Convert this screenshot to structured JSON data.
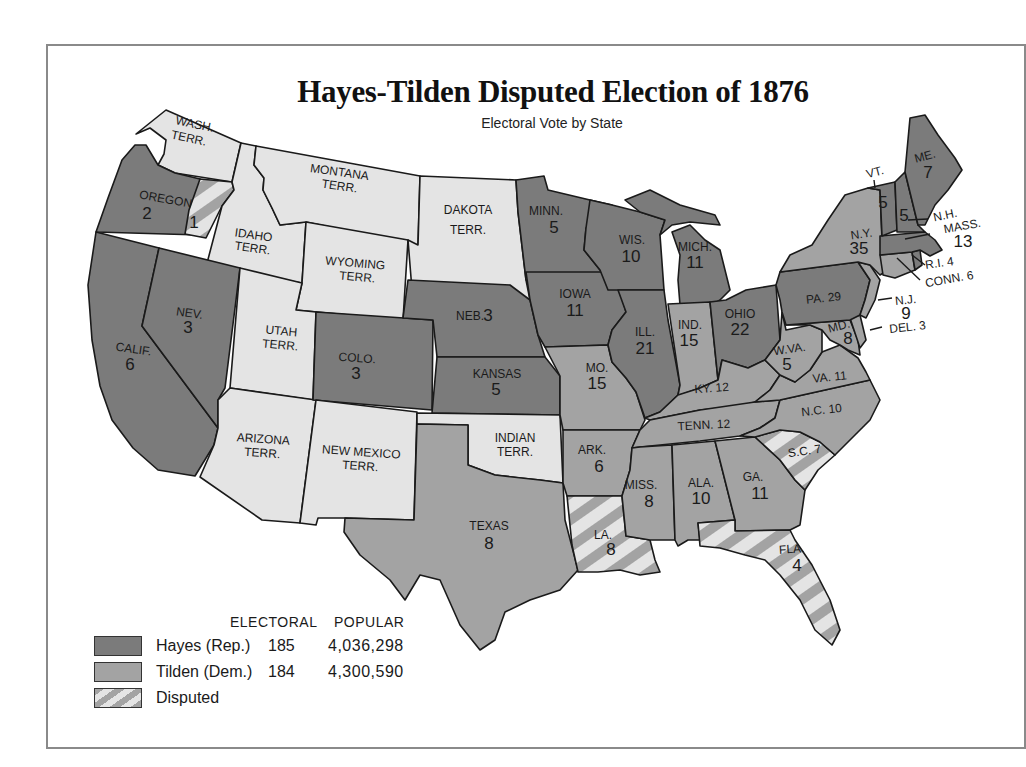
{
  "title": "Hayes-Tilden Disputed Election of 1876",
  "subtitle": "Electoral Vote by State",
  "colors": {
    "hayes": "#7b7b7b",
    "tilden": "#a3a3a3",
    "territory": "#e4e4e4",
    "disputed_stripe_a": "#a3a3a3",
    "disputed_stripe_b": "#e4e4e4",
    "frame": "#8a8a8a"
  },
  "legend": {
    "header_electoral": "ELECTORAL",
    "header_popular": "POPULAR",
    "entries": [
      {
        "key": "hayes",
        "label": "Hayes (Rep.)",
        "electoral": "185",
        "popular": "4,036,298"
      },
      {
        "key": "tilden",
        "label": "Tilden (Dem.)",
        "electoral": "184",
        "popular": "4,300,590"
      },
      {
        "key": "disputed",
        "label": "Disputed"
      }
    ]
  },
  "regions": [
    {
      "id": "wash",
      "name": "WASH.",
      "line2": "TERR.",
      "result": "territory"
    },
    {
      "id": "oregon",
      "name": "OREGON",
      "votes": "2",
      "result": "hayes"
    },
    {
      "id": "oregon_disputed",
      "votes": "1",
      "result": "disputed"
    },
    {
      "id": "calif",
      "name": "CALIF.",
      "votes": "6",
      "result": "hayes"
    },
    {
      "id": "nev",
      "name": "NEV.",
      "votes": "3",
      "result": "hayes"
    },
    {
      "id": "idaho",
      "name": "IDAHO",
      "line2": "TERR.",
      "result": "territory"
    },
    {
      "id": "montana",
      "name": "MONTANA",
      "line2": "TERR.",
      "result": "territory"
    },
    {
      "id": "wyoming",
      "name": "WYOMING",
      "line2": "TERR.",
      "result": "territory"
    },
    {
      "id": "utah",
      "name": "UTAH",
      "line2": "TERR.",
      "result": "territory"
    },
    {
      "id": "arizona",
      "name": "ARIZONA",
      "line2": "TERR.",
      "result": "territory"
    },
    {
      "id": "colo",
      "name": "COLO.",
      "votes": "3",
      "result": "hayes"
    },
    {
      "id": "newmexico",
      "name": "NEW MEXICO",
      "line2": "TERR.",
      "result": "territory"
    },
    {
      "id": "dakota",
      "name": "DAKOTA",
      "line2": "TERR.",
      "result": "territory"
    },
    {
      "id": "neb",
      "name": "NEB.",
      "votes": "3",
      "result": "hayes"
    },
    {
      "id": "kansas",
      "name": "KANSAS",
      "votes": "5",
      "result": "hayes"
    },
    {
      "id": "indian",
      "name": "INDIAN",
      "line2": "TERR.",
      "result": "territory"
    },
    {
      "id": "texas",
      "name": "TEXAS",
      "votes": "8",
      "result": "tilden"
    },
    {
      "id": "minn",
      "name": "MINN.",
      "votes": "5",
      "result": "hayes"
    },
    {
      "id": "iowa",
      "name": "IOWA",
      "votes": "11",
      "result": "hayes"
    },
    {
      "id": "mo",
      "name": "MO.",
      "votes": "15",
      "result": "tilden"
    },
    {
      "id": "ark",
      "name": "ARK.",
      "votes": "6",
      "result": "tilden"
    },
    {
      "id": "la",
      "name": "LA.",
      "votes": "8",
      "result": "disputed"
    },
    {
      "id": "wis",
      "name": "WIS.",
      "votes": "10",
      "result": "hayes"
    },
    {
      "id": "ill",
      "name": "ILL.",
      "votes": "21",
      "result": "hayes"
    },
    {
      "id": "mich",
      "name": "MICH.",
      "votes": "11",
      "result": "hayes"
    },
    {
      "id": "ind",
      "name": "IND.",
      "votes": "15",
      "result": "tilden"
    },
    {
      "id": "ohio",
      "name": "OHIO",
      "votes": "22",
      "result": "hayes"
    },
    {
      "id": "ky",
      "name": "KY.",
      "votes": "12",
      "result": "tilden"
    },
    {
      "id": "tenn",
      "name": "TENN.",
      "votes": "12",
      "result": "tilden"
    },
    {
      "id": "miss",
      "name": "MISS.",
      "votes": "8",
      "result": "tilden"
    },
    {
      "id": "ala",
      "name": "ALA.",
      "votes": "10",
      "result": "tilden"
    },
    {
      "id": "ga",
      "name": "GA.",
      "votes": "11",
      "result": "tilden"
    },
    {
      "id": "fla",
      "name": "FLA.",
      "votes": "4",
      "result": "disputed"
    },
    {
      "id": "sc",
      "name": "S.C.",
      "votes": "7",
      "result": "disputed"
    },
    {
      "id": "nc",
      "name": "N.C.",
      "votes": "10",
      "result": "tilden"
    },
    {
      "id": "va",
      "name": "VA.",
      "votes": "11",
      "result": "tilden"
    },
    {
      "id": "wva",
      "name": "W.VA.",
      "votes": "5",
      "result": "tilden"
    },
    {
      "id": "md",
      "name": "MD.",
      "votes": "8",
      "result": "tilden"
    },
    {
      "id": "del",
      "name": "DEL.",
      "votes": "3",
      "result": "tilden"
    },
    {
      "id": "pa",
      "name": "PA.",
      "votes": "29",
      "result": "hayes"
    },
    {
      "id": "nj",
      "name": "N.J.",
      "votes": "9",
      "result": "tilden"
    },
    {
      "id": "ny",
      "name": "N.Y.",
      "votes": "35",
      "result": "tilden"
    },
    {
      "id": "conn",
      "name": "CONN.",
      "votes": "6",
      "result": "tilden"
    },
    {
      "id": "ri",
      "name": "R.I.",
      "votes": "4",
      "result": "hayes"
    },
    {
      "id": "mass",
      "name": "MASS.",
      "votes": "13",
      "result": "hayes"
    },
    {
      "id": "vt",
      "name": "VT.",
      "votes": "5",
      "result": "hayes"
    },
    {
      "id": "nh",
      "name": "N.H.",
      "votes": "5",
      "result": "hayes"
    },
    {
      "id": "me",
      "name": "ME.",
      "votes": "7",
      "result": "hayes"
    }
  ],
  "labels": {
    "wash": [
      "WASH.",
      "TERR."
    ],
    "oregon": [
      "OREGON",
      "2"
    ],
    "oregon_disputed": [
      "1"
    ],
    "calif": [
      "CALIF.",
      "6"
    ],
    "nev": [
      "NEV.",
      "3"
    ],
    "idaho": [
      "IDAHO",
      "TERR."
    ],
    "montana": [
      "MONTANA",
      "TERR."
    ],
    "wyoming": [
      "WYOMING",
      "TERR."
    ],
    "utah": [
      "UTAH",
      "TERR."
    ],
    "arizona": [
      "ARIZONA",
      "TERR."
    ],
    "colo": [
      "COLO.",
      "3"
    ],
    "newmexico": [
      "NEW MEXICO",
      "TERR."
    ],
    "dakota": [
      "DAKOTA",
      "TERR."
    ],
    "neb": [
      "NEB.",
      "3"
    ],
    "kansas": [
      "KANSAS",
      "5"
    ],
    "indian": [
      "INDIAN",
      "TERR."
    ],
    "texas": [
      "TEXAS",
      "8"
    ],
    "minn": [
      "MINN.",
      "5"
    ],
    "iowa": [
      "IOWA",
      "11"
    ],
    "mo": [
      "MO.",
      "15"
    ],
    "ark": [
      "ARK.",
      "6"
    ],
    "la": [
      "LA.",
      "8"
    ],
    "wis": [
      "WIS.",
      "10"
    ],
    "ill": [
      "ILL.",
      "21"
    ],
    "mich": [
      "MICH.",
      "11"
    ],
    "ind": [
      "IND.",
      "15"
    ],
    "ohio": [
      "OHIO",
      "22"
    ],
    "ky": [
      "KY. 12"
    ],
    "tenn": [
      "TENN. 12"
    ],
    "miss": [
      "MISS.",
      "8"
    ],
    "ala": [
      "ALA.",
      "10"
    ],
    "ga": [
      "GA.",
      "11"
    ],
    "fla": [
      "FLA.",
      "4"
    ],
    "sc": [
      "S.C. 7"
    ],
    "nc": [
      "N.C. 10"
    ],
    "va": [
      "VA. 11"
    ],
    "wva": [
      "W.VA.",
      "5"
    ],
    "md": [
      "MD.",
      "8"
    ],
    "del": [
      "DEL. 3"
    ],
    "pa": [
      "PA. 29"
    ],
    "nj": [
      "N.J.",
      "9"
    ],
    "ny": [
      "N.Y.",
      "35"
    ],
    "conn": [
      "CONN. 6"
    ],
    "ri": [
      "R.I. 4"
    ],
    "mass": [
      "MASS.",
      "13"
    ],
    "vt": [
      "VT.",
      "5"
    ],
    "nh": [
      "N.H.",
      "5"
    ],
    "me": [
      "ME.",
      "7"
    ]
  }
}
